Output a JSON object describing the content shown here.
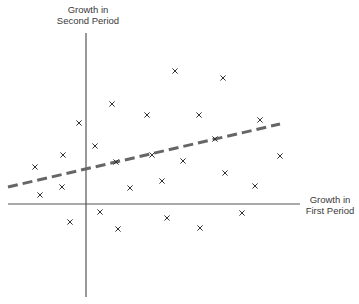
{
  "chart_data": {
    "type": "scatter",
    "title": "",
    "xlabel": "Growth in First Period",
    "ylabel": "Growth in Second Period",
    "xlabel_lines": [
      "Growth in",
      "First Period"
    ],
    "ylabel_lines": [
      "Growth in",
      "Second Period"
    ],
    "marker": "x",
    "grid": false,
    "axes_origin_px": [
      86,
      204
    ],
    "points_px": [
      [
        175,
        71
      ],
      [
        223,
        78
      ],
      [
        112,
        104
      ],
      [
        147,
        115
      ],
      [
        199,
        115
      ],
      [
        79,
        123
      ],
      [
        260,
        120
      ],
      [
        95,
        146
      ],
      [
        63,
        155
      ],
      [
        215,
        139
      ],
      [
        35,
        167
      ],
      [
        116,
        162
      ],
      [
        152,
        155
      ],
      [
        183,
        161
      ],
      [
        280,
        156
      ],
      [
        62,
        187
      ],
      [
        40,
        195
      ],
      [
        130,
        188
      ],
      [
        162,
        181
      ],
      [
        225,
        173
      ],
      [
        255,
        186
      ],
      [
        100,
        212
      ],
      [
        70,
        222
      ],
      [
        118,
        229
      ],
      [
        167,
        218
      ],
      [
        200,
        228
      ],
      [
        242,
        213
      ]
    ],
    "points": [
      {
        "x": 89,
        "y": 133
      },
      {
        "x": 137,
        "y": 126
      },
      {
        "x": 26,
        "y": 100
      },
      {
        "x": 61,
        "y": 89
      },
      {
        "x": 113,
        "y": 89
      },
      {
        "x": -7,
        "y": 81
      },
      {
        "x": 174,
        "y": 84
      },
      {
        "x": 9,
        "y": 58
      },
      {
        "x": -23,
        "y": 49
      },
      {
        "x": 129,
        "y": 65
      },
      {
        "x": -51,
        "y": 37
      },
      {
        "x": 30,
        "y": 42
      },
      {
        "x": 66,
        "y": 49
      },
      {
        "x": 97,
        "y": 43
      },
      {
        "x": 194,
        "y": 48
      },
      {
        "x": -24,
        "y": 17
      },
      {
        "x": -46,
        "y": 9
      },
      {
        "x": 44,
        "y": 16
      },
      {
        "x": 76,
        "y": 23
      },
      {
        "x": 139,
        "y": 31
      },
      {
        "x": 169,
        "y": 18
      },
      {
        "x": 14,
        "y": -8
      },
      {
        "x": -16,
        "y": -18
      },
      {
        "x": 32,
        "y": -25
      },
      {
        "x": 81,
        "y": -14
      },
      {
        "x": 114,
        "y": -24
      },
      {
        "x": 156,
        "y": -9
      }
    ],
    "trend_line": {
      "style": "dashed",
      "color": "#666666",
      "from_px": [
        8,
        187
      ],
      "to_px": [
        280,
        124
      ],
      "slope_approx": 0.23,
      "intercept_approx": 35
    },
    "axis_color": "#555555",
    "marker_color": "#333333"
  }
}
